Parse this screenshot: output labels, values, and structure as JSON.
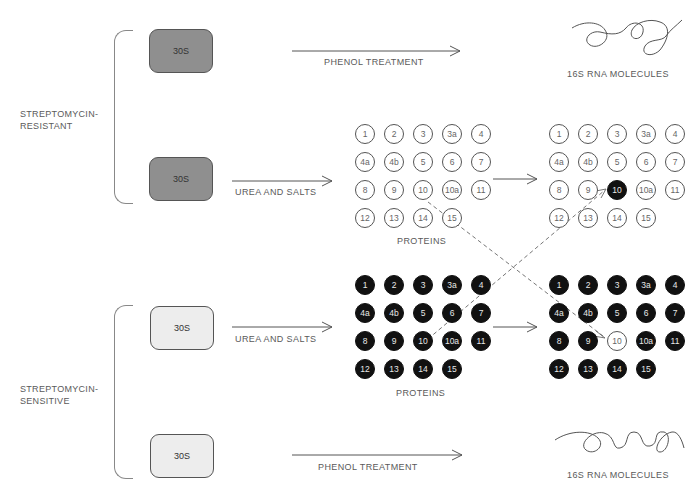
{
  "groups": {
    "resistant": {
      "label_line1": "STREPTOMYCIN-",
      "label_line2": "RESISTANT",
      "ribosome_top": "30S",
      "ribosome_bottom": "30S",
      "color": "#8f8f8f"
    },
    "sensitive": {
      "label_line1": "STREPTOMYCIN-",
      "label_line2": "SENSITIVE",
      "ribosome_top": "30S",
      "ribosome_bottom": "30S",
      "color": "#ededed"
    }
  },
  "steps": {
    "phenol_top": "PHENOL TREATMENT",
    "phenol_bottom": "PHENOL TREATMENT",
    "urea_top": "UREA AND SALTS",
    "urea_bottom": "UREA AND SALTS"
  },
  "products": {
    "rna_top": "16S RNA MOLECULES",
    "rna_bottom": "16S RNA MOLECULES",
    "proteins_top": "PROTEINS",
    "proteins_bottom": "PROTEINS"
  },
  "protein_ids": [
    "1",
    "2",
    "3",
    "3a",
    "4",
    "4a",
    "4b",
    "5",
    "6",
    "7",
    "8",
    "9",
    "10",
    "10a",
    "11",
    "12",
    "13",
    "14",
    "15"
  ],
  "grids": {
    "resistant_proteins": {
      "fill": "open",
      "swapped": null
    },
    "resistant_reconstituted": {
      "fill": "open",
      "swapped": "10"
    },
    "sensitive_proteins": {
      "fill": "filled",
      "swapped": null
    },
    "sensitive_reconstituted": {
      "fill": "filled",
      "swapped": "10"
    }
  }
}
